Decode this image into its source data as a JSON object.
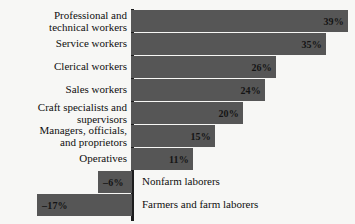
{
  "chart_data": {
    "type": "bar",
    "orientation": "horizontal",
    "title": "",
    "subtitle": "",
    "xlabel": "",
    "ylabel": "",
    "grid": false,
    "legend": null,
    "axis": {
      "zero_line": true,
      "xlim": [
        -20,
        40
      ],
      "value_suffix": "%"
    },
    "categories": [
      "Professional and\ntechnical workers",
      "Service workers",
      "Clerical workers",
      "Sales workers",
      "Craft specialists and\nsupervisors",
      "Managers, officials,\nand proprietors",
      "Operatives",
      "Nonfarm laborers",
      "Farmers and farm laborers"
    ],
    "values": [
      39,
      35,
      26,
      24,
      20,
      15,
      11,
      -6,
      -17
    ],
    "value_labels": [
      "39%",
      "35%",
      "26%",
      "24%",
      "20%",
      "15%",
      "11%",
      "–6%",
      "–17%"
    ],
    "bars": [
      {
        "category": "Professional and\ntechnical workers",
        "value": 39,
        "label": "39%",
        "label_side": "inside-right",
        "category_side": "left",
        "top": 10,
        "start": 131,
        "width": 217
      },
      {
        "category": "Service workers",
        "value": 35,
        "label": "35%",
        "label_side": "inside-right",
        "category_side": "left",
        "top": 33,
        "start": 131,
        "width": 195
      },
      {
        "category": "Clerical workers",
        "value": 26,
        "label": "26%",
        "label_side": "inside-right",
        "category_side": "left",
        "top": 56,
        "start": 131,
        "width": 145
      },
      {
        "category": "Sales workers",
        "value": 24,
        "label": "24%",
        "label_side": "inside-right",
        "category_side": "left",
        "top": 79,
        "start": 131,
        "width": 134
      },
      {
        "category": "Craft specialists and\nsupervisors",
        "value": 20,
        "label": "20%",
        "label_side": "inside-right",
        "category_side": "left",
        "top": 102,
        "start": 131,
        "width": 112
      },
      {
        "category": "Managers, officials,\nand proprietors",
        "value": 15,
        "label": "15%",
        "label_side": "inside-right",
        "category_side": "left",
        "top": 125,
        "start": 131,
        "width": 84
      },
      {
        "category": "Operatives",
        "value": 11,
        "label": "11%",
        "label_side": "inside-right",
        "category_side": "left",
        "top": 148,
        "start": 131,
        "width": 62
      },
      {
        "category": "Nonfarm laborers",
        "value": -6,
        "label": "–6%",
        "label_side": "inside-left",
        "category_side": "right",
        "top": 171,
        "start": 98,
        "width": 34
      },
      {
        "category": "Farmers and farm laborers",
        "value": -17,
        "label": "–17%",
        "label_side": "inside-left",
        "category_side": "right",
        "top": 194,
        "start": 37,
        "width": 95
      }
    ],
    "colors": {
      "bar": "#565656",
      "axis": "#1d1d1d",
      "background": "#f7f7f5",
      "text": "#0f0f0f"
    }
  }
}
